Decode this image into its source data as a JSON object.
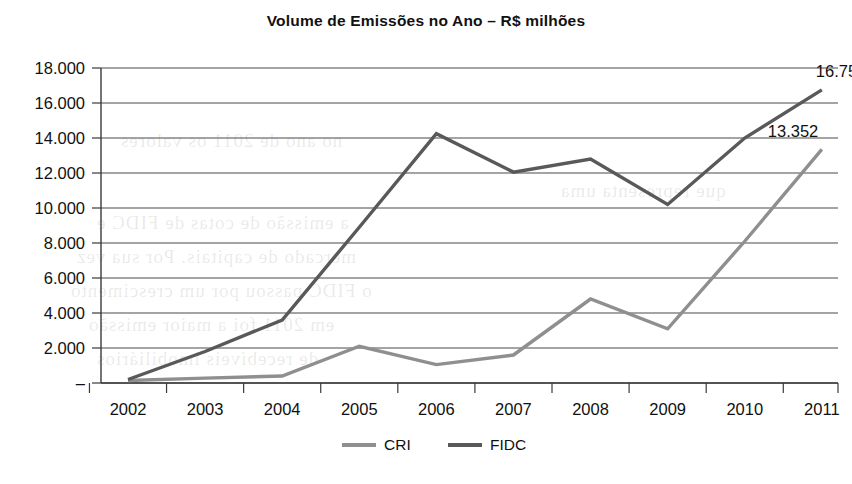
{
  "chart_data": {
    "type": "line",
    "title": "Volume de Emissões no Ano – R$ milhões",
    "xlabel": "",
    "ylabel": "",
    "categories": [
      "2002",
      "2003",
      "2004",
      "2005",
      "2006",
      "2007",
      "2008",
      "2009",
      "2010",
      "2011"
    ],
    "series": [
      {
        "name": "CRI",
        "color": "#8f8f8f",
        "values": [
          140,
          280,
          400,
          2100,
          1050,
          1600,
          4800,
          3100,
          8100,
          13352
        ]
      },
      {
        "name": "FIDC",
        "color": "#595959",
        "values": [
          200,
          1800,
          3600,
          8900,
          14250,
          12050,
          12800,
          10200,
          14000,
          16752
        ]
      }
    ],
    "ylim": [
      0,
      18000
    ],
    "ytick_values": [
      0,
      2000,
      4000,
      6000,
      8000,
      10000,
      12000,
      14000,
      16000,
      18000
    ],
    "ytick_labels": [
      "–",
      "2.000",
      "4.000",
      "6.000",
      "8.000",
      "10.000",
      "12.000",
      "14.000",
      "16.000",
      "18.000"
    ],
    "grid": true,
    "legend_position": "bottom",
    "annotations": [
      {
        "text": "16.752",
        "series": "FIDC",
        "category": "2011",
        "value": 16752
      },
      {
        "text": "13.352",
        "series": "CRI",
        "category": "2011",
        "value": 13352
      }
    ]
  },
  "legend": {
    "items": [
      {
        "label": "CRI",
        "color": "#8f8f8f"
      },
      {
        "label": "FIDC",
        "color": "#595959"
      }
    ]
  },
  "background_bleed": [
    {
      "text": "a emissão de cotas de FIDC e",
      "x": 96,
      "y": 212
    },
    {
      "text": "mercado de capitais. Por sua vez",
      "x": 76,
      "y": 246
    },
    {
      "text": "o FIDC passou por um crescimento",
      "x": 70,
      "y": 280
    },
    {
      "text": "em 2011 foi a maior emissão",
      "x": 88,
      "y": 314
    },
    {
      "text": "de recebíveis imobiliários",
      "x": 96,
      "y": 348
    },
    {
      "text": "no ano de 2011 os valores",
      "x": 120,
      "y": 130
    },
    {
      "text": "que representa uma",
      "x": 560,
      "y": 180
    }
  ]
}
